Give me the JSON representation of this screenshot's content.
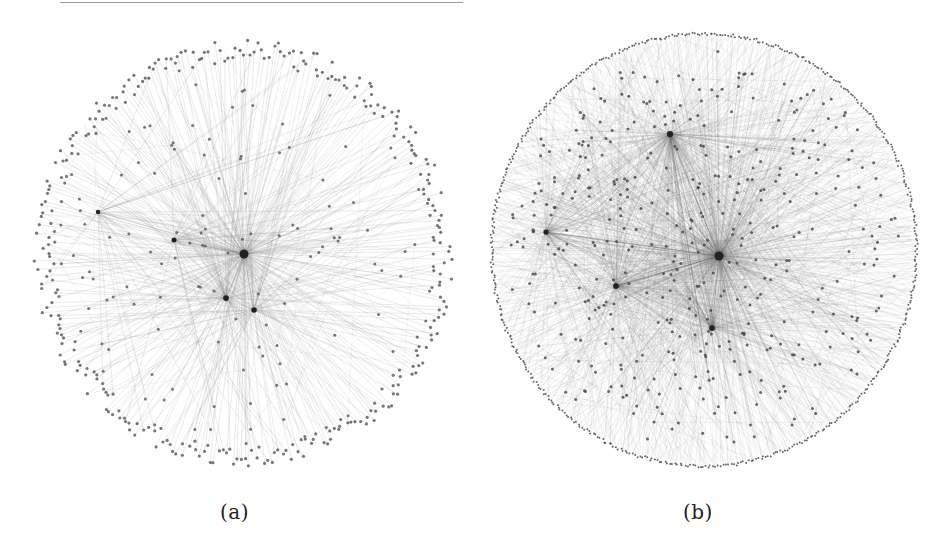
{
  "figure": {
    "subfigures": [
      {
        "id": "a",
        "caption": "(a)",
        "description": "Radial network layout, sparse periphery of leaf nodes connected to a central hub",
        "layout": {
          "cx": 216,
          "cy": 224,
          "rx": 210,
          "ry": 214
        },
        "hubs": [
          {
            "x": 216,
            "y": 224,
            "weight": 1.0
          },
          {
            "x": 198,
            "y": 268,
            "weight": 0.35
          },
          {
            "x": 226,
            "y": 280,
            "weight": 0.3
          },
          {
            "x": 146,
            "y": 210,
            "weight": 0.2
          },
          {
            "x": 70,
            "y": 182,
            "weight": 0.1
          }
        ],
        "outer_nodes": 330,
        "inner_nodes": 120,
        "edge_color": "#8a8a8a",
        "node_color": "#555555"
      },
      {
        "id": "b",
        "caption": "(b)",
        "description": "Radial network layout, dense edges with ring of nodes on the boundary",
        "layout": {
          "cx": 220,
          "cy": 222,
          "rx": 214,
          "ry": 218
        },
        "hubs": [
          {
            "x": 235,
            "y": 228,
            "weight": 1.0
          },
          {
            "x": 186,
            "y": 106,
            "weight": 0.45
          },
          {
            "x": 132,
            "y": 258,
            "weight": 0.35
          },
          {
            "x": 228,
            "y": 300,
            "weight": 0.35
          },
          {
            "x": 62,
            "y": 204,
            "weight": 0.25
          }
        ],
        "outer_nodes": 520,
        "inner_nodes": 420,
        "edge_color": "#6a6a6a",
        "node_color": "#444444"
      }
    ]
  }
}
